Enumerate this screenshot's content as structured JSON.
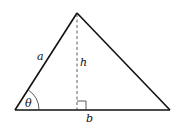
{
  "diagram": {
    "type": "triangle-with-altitude",
    "colors": {
      "stroke": "#111111",
      "background": "#ffffff"
    },
    "vertices": {
      "apex": {
        "x": 77,
        "y": 13
      },
      "bottom_left": {
        "x": 15,
        "y": 110
      },
      "bottom_right": {
        "x": 170,
        "y": 110
      }
    },
    "labels": {
      "side_a": "a",
      "height": "h",
      "base": "b",
      "angle": "θ"
    },
    "annotations": {
      "altitude": "dashed line from apex perpendicular to base",
      "right_angle_marker": "square at foot of altitude",
      "angle_arc": "arc at bottom-left vertex marking angle θ"
    }
  }
}
